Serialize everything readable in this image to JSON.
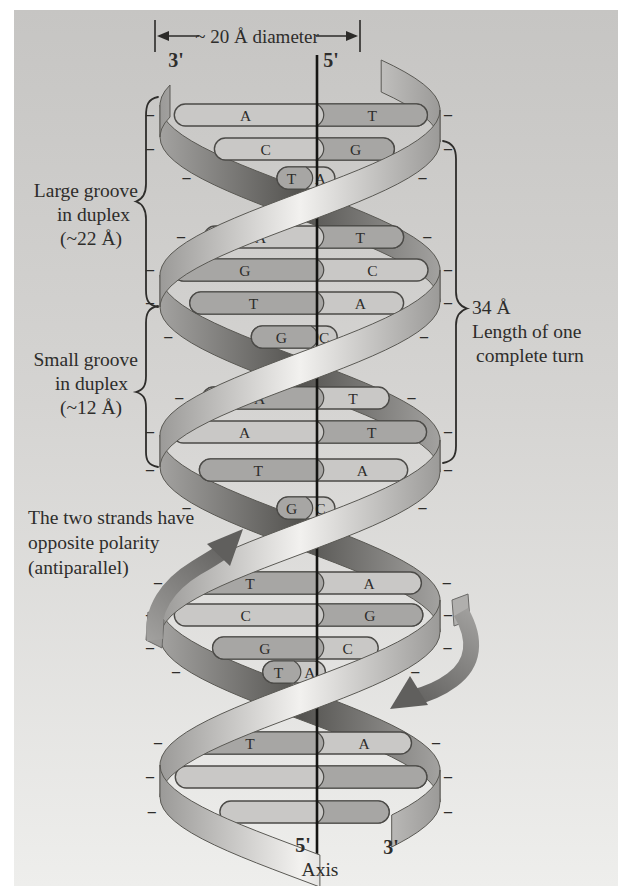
{
  "figure": {
    "diameter_label": "~ 20 Å diameter",
    "axis_label": "Axis",
    "strand_ends": {
      "top_left": "3'",
      "top_right": "5'",
      "bottom_left": "5'",
      "bottom_right": "3'"
    },
    "large_groove_label": [
      "Large groove",
      "in duplex",
      "(~22 Å)"
    ],
    "small_groove_label": [
      "Small groove",
      "in duplex",
      "(~12 Å)"
    ],
    "turn_label": [
      "34 Å",
      "Length of one",
      "complete turn"
    ],
    "antiparallel_label": [
      "The two strands have",
      "opposite polarity",
      "(antiparallel)"
    ],
    "phosphate_charge_symbol": "–",
    "base_pairs": [
      {
        "left": "A",
        "right": "T",
        "y": 115,
        "dark": "right"
      },
      {
        "left": "C",
        "right": "G",
        "y": 149,
        "dark": "right"
      },
      {
        "left": "T",
        "right": "A",
        "y": 178,
        "dark": "left"
      },
      {
        "left": "A",
        "right": "T",
        "y": 237,
        "dark": "right"
      },
      {
        "left": "G",
        "right": "C",
        "y": 270,
        "dark": "left"
      },
      {
        "left": "T",
        "right": "A",
        "y": 303,
        "dark": "left"
      },
      {
        "left": "G",
        "right": "C",
        "y": 337,
        "dark": "left"
      },
      {
        "left": "A",
        "right": "T",
        "y": 398,
        "dark": "left"
      },
      {
        "left": "A",
        "right": "T",
        "y": 432,
        "dark": "right"
      },
      {
        "left": "T",
        "right": "A",
        "y": 470,
        "dark": "left"
      },
      {
        "left": "G",
        "right": "C",
        "y": 508,
        "dark": "left"
      },
      {
        "left": "T",
        "right": "A",
        "y": 583,
        "dark": "left"
      },
      {
        "left": "C",
        "right": "G",
        "y": 615,
        "dark": "right"
      },
      {
        "left": "G",
        "right": "C",
        "y": 648,
        "dark": "left"
      },
      {
        "left": "T",
        "right": "A",
        "y": 672,
        "dark": "left"
      },
      {
        "left": "T",
        "right": "A",
        "y": 743,
        "dark": "left"
      },
      {
        "left": null,
        "right": null,
        "y": 777,
        "dark": "right"
      },
      {
        "left": null,
        "right": null,
        "y": 812,
        "dark": "right"
      }
    ],
    "colors": {
      "ink": "#2e2d2b",
      "rod_light": "#c9c8c6",
      "rod_dark": "#a7a6a4",
      "rod_outline": "#4b4a47",
      "letter": "#393835",
      "ribbon_highlight": "#f2f1ef",
      "ribbon_shadow": "#545350",
      "ribbon_mid": "#9b9a98",
      "background_top": "#c6c5c3",
      "background_bottom": "#eeeeec",
      "arrow_dark": "#605f5d"
    }
  }
}
